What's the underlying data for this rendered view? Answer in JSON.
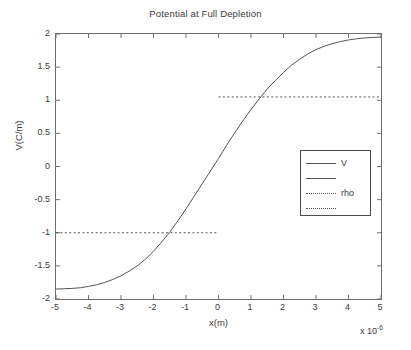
{
  "chart_data": {
    "type": "line",
    "title": "Potential at Full Depletion",
    "xlabel": "x(m)",
    "ylabel": "V(C/m)",
    "xlim": [
      -5,
      5
    ],
    "ylim": [
      -2,
      2
    ],
    "x_exponent_prefix": "x 10",
    "x_exponent_power": "-6",
    "grid": false,
    "legend_position": "center-right",
    "xticks": [
      "-5",
      "-4",
      "-3",
      "-2",
      "-1",
      "0",
      "1",
      "2",
      "3",
      "4",
      "5"
    ],
    "xtick_values": [
      -5,
      -4,
      -3,
      -2,
      -1,
      0,
      1,
      2,
      3,
      4,
      5
    ],
    "yticks": [
      "2",
      "1.5",
      "1",
      "0.5",
      "0",
      "-0.5",
      "-1",
      "-1.5",
      "-2"
    ],
    "ytick_values": [
      2,
      1.5,
      1,
      0.5,
      0,
      -0.5,
      -1,
      -1.5,
      -2
    ],
    "series": [
      {
        "name": "V",
        "style": "solid",
        "color": "#555555",
        "x": [
          -5,
          -4.75,
          -4.5,
          -4.25,
          -4,
          -3.75,
          -3.5,
          -3.25,
          -3,
          -2.75,
          -2.5,
          -2.25,
          -2,
          -1.75,
          -1.5,
          -1.25,
          -1,
          -0.75,
          -0.5,
          -0.25,
          0,
          0.25,
          0.5,
          0.75,
          1,
          1.25,
          1.5,
          1.75,
          2,
          2.25,
          2.5,
          2.75,
          3,
          3.25,
          3.5,
          3.75,
          4,
          4.25,
          4.5,
          4.75,
          5
        ],
        "y": [
          -1.85,
          -1.845,
          -1.84,
          -1.83,
          -1.81,
          -1.785,
          -1.75,
          -1.705,
          -1.65,
          -1.58,
          -1.5,
          -1.4,
          -1.28,
          -1.14,
          -0.99,
          -0.82,
          -0.64,
          -0.45,
          -0.26,
          -0.07,
          0.12,
          0.32,
          0.51,
          0.69,
          0.86,
          1.02,
          1.17,
          1.3,
          1.42,
          1.53,
          1.62,
          1.7,
          1.765,
          1.815,
          1.855,
          1.885,
          1.91,
          1.928,
          1.94,
          1.948,
          1.955
        ]
      },
      {
        "name": "rho-negative",
        "style": "dotted",
        "color": "#555555",
        "x": [
          -5,
          0
        ],
        "y": [
          -1,
          -1
        ]
      },
      {
        "name": "rho-positive",
        "style": "dotted",
        "color": "#555555",
        "x": [
          0,
          5
        ],
        "y": [
          1.05,
          1.05
        ]
      }
    ],
    "legend_entries": [
      {
        "label": "V",
        "style": "solid"
      },
      {
        "label": "",
        "style": "solid"
      },
      {
        "label": "rho",
        "style": "dotted"
      },
      {
        "label": "",
        "style": "dotted"
      }
    ]
  }
}
